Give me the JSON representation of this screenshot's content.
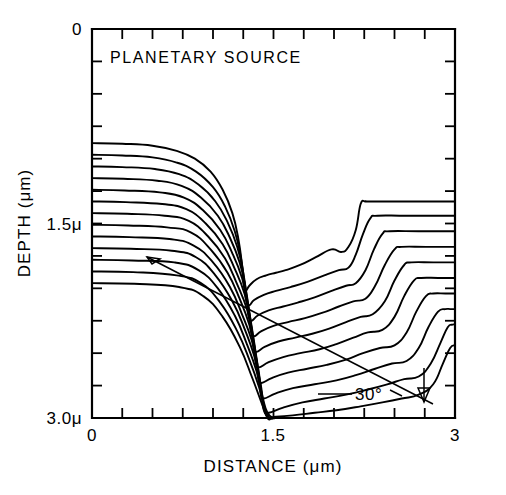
{
  "figure": {
    "title": "PLANETARY SOURCE",
    "annotation_angle": "30°",
    "background_color": "#ffffff",
    "line_color": "#000000"
  },
  "chart_data": {
    "type": "line",
    "title": "PLANETARY SOURCE",
    "xlabel": "DISTANCE  (μm)",
    "ylabel": "DEPTH  (μm)",
    "xlim": [
      0,
      3
    ],
    "ylim": [
      3,
      0
    ],
    "y_inverted": true,
    "grid": false,
    "legend": "none",
    "xticks": [
      0,
      0.25,
      0.5,
      0.75,
      1.0,
      1.25,
      1.5,
      1.75,
      2.0,
      2.25,
      2.5,
      2.75,
      3.0
    ],
    "xticklabels": [
      "0",
      "",
      "",
      "",
      "",
      "",
      "1.5",
      "",
      "",
      "",
      "",
      "",
      "3"
    ],
    "yticks": [
      0,
      0.25,
      0.5,
      0.75,
      1.0,
      1.25,
      1.5,
      1.75,
      2.0,
      2.25,
      2.5,
      2.75,
      3.0
    ],
    "yticklabels": [
      "0",
      "",
      "",
      "",
      "",
      "",
      "1.5μ",
      "",
      "",
      "",
      "",
      "",
      "3.0μ"
    ],
    "annotations": [
      {
        "text": "PLANETARY SOURCE",
        "x": 0.16,
        "y": 0.22
      },
      {
        "text": "30°",
        "x": 2.09,
        "y": 2.82
      },
      {
        "text": "ion-beam-direction-arrow",
        "from_x": 0.46,
        "from_y": 1.72,
        "to_x": 2.58,
        "to_y": 2.95
      }
    ],
    "series": [
      {
        "name": "profile-01",
        "x": [
          0.0,
          0.25,
          0.5,
          0.7,
          0.85,
          0.98,
          1.08,
          1.16,
          1.21,
          1.24,
          1.255,
          1.27,
          1.3,
          1.36,
          1.44,
          1.52,
          1.6,
          1.72,
          1.85,
          1.98,
          2.06,
          2.12,
          2.18,
          2.22,
          2.26,
          2.3,
          2.6,
          3.0
        ],
        "y": [
          0.88,
          0.885,
          0.9,
          0.94,
          1.0,
          1.1,
          1.24,
          1.42,
          1.62,
          1.82,
          1.98,
          2.02,
          1.98,
          1.93,
          1.9,
          1.88,
          1.86,
          1.82,
          1.76,
          1.7,
          1.72,
          1.68,
          1.55,
          1.35,
          1.33,
          1.33,
          1.33,
          1.33
        ]
      },
      {
        "name": "profile-02",
        "x": [
          0.0,
          0.25,
          0.5,
          0.7,
          0.86,
          1.0,
          1.1,
          1.18,
          1.23,
          1.26,
          1.275,
          1.3,
          1.34,
          1.42,
          1.52,
          1.64,
          1.78,
          1.92,
          2.04,
          2.12,
          2.18,
          2.24,
          2.3,
          2.36,
          2.6,
          3.0
        ],
        "y": [
          0.97,
          0.975,
          0.99,
          1.03,
          1.1,
          1.22,
          1.37,
          1.56,
          1.76,
          1.96,
          2.1,
          2.13,
          2.09,
          2.05,
          2.02,
          1.99,
          1.95,
          1.9,
          1.86,
          1.84,
          1.74,
          1.58,
          1.46,
          1.44,
          1.44,
          1.44
        ]
      },
      {
        "name": "profile-03",
        "x": [
          0.0,
          0.25,
          0.52,
          0.72,
          0.88,
          1.02,
          1.12,
          1.2,
          1.25,
          1.28,
          1.295,
          1.32,
          1.37,
          1.46,
          1.58,
          1.7,
          1.84,
          1.98,
          2.1,
          2.18,
          2.26,
          2.33,
          2.4,
          2.46,
          2.7,
          3.0
        ],
        "y": [
          1.06,
          1.065,
          1.08,
          1.12,
          1.2,
          1.33,
          1.49,
          1.68,
          1.88,
          2.08,
          2.22,
          2.25,
          2.21,
          2.17,
          2.14,
          2.11,
          2.07,
          2.02,
          1.98,
          1.96,
          1.86,
          1.7,
          1.58,
          1.56,
          1.56,
          1.56
        ]
      },
      {
        "name": "profile-04",
        "x": [
          0.0,
          0.26,
          0.54,
          0.74,
          0.9,
          1.04,
          1.14,
          1.22,
          1.27,
          1.3,
          1.315,
          1.34,
          1.4,
          1.5,
          1.62,
          1.76,
          1.9,
          2.04,
          2.16,
          2.26,
          2.34,
          2.42,
          2.5,
          2.56,
          2.76,
          3.0
        ],
        "y": [
          1.15,
          1.155,
          1.17,
          1.21,
          1.3,
          1.44,
          1.61,
          1.8,
          2.0,
          2.2,
          2.34,
          2.37,
          2.33,
          2.29,
          2.26,
          2.23,
          2.19,
          2.14,
          2.1,
          2.08,
          1.98,
          1.82,
          1.7,
          1.68,
          1.68,
          1.68
        ]
      },
      {
        "name": "profile-05",
        "x": [
          0.0,
          0.27,
          0.56,
          0.76,
          0.92,
          1.06,
          1.16,
          1.24,
          1.29,
          1.32,
          1.335,
          1.36,
          1.43,
          1.54,
          1.68,
          1.82,
          1.96,
          2.1,
          2.22,
          2.32,
          2.42,
          2.5,
          2.58,
          2.64,
          2.82,
          3.0
        ],
        "y": [
          1.24,
          1.245,
          1.26,
          1.3,
          1.4,
          1.55,
          1.73,
          1.92,
          2.12,
          2.32,
          2.46,
          2.49,
          2.45,
          2.41,
          2.38,
          2.35,
          2.31,
          2.26,
          2.22,
          2.2,
          2.1,
          1.94,
          1.82,
          1.8,
          1.8,
          1.8
        ]
      },
      {
        "name": "profile-06",
        "x": [
          0.0,
          0.28,
          0.58,
          0.78,
          0.94,
          1.08,
          1.18,
          1.26,
          1.31,
          1.34,
          1.355,
          1.38,
          1.46,
          1.58,
          1.72,
          1.88,
          2.02,
          2.16,
          2.28,
          2.4,
          2.5,
          2.58,
          2.66,
          2.72,
          2.86,
          3.0
        ],
        "y": [
          1.33,
          1.335,
          1.35,
          1.39,
          1.5,
          1.66,
          1.85,
          2.04,
          2.24,
          2.44,
          2.58,
          2.61,
          2.57,
          2.53,
          2.5,
          2.47,
          2.43,
          2.38,
          2.34,
          2.32,
          2.22,
          2.06,
          1.94,
          1.92,
          1.92,
          1.92
        ]
      },
      {
        "name": "profile-07",
        "x": [
          0.0,
          0.29,
          0.6,
          0.8,
          0.96,
          1.1,
          1.2,
          1.28,
          1.33,
          1.36,
          1.375,
          1.4,
          1.49,
          1.62,
          1.78,
          1.94,
          2.1,
          2.24,
          2.38,
          2.5,
          2.6,
          2.68,
          2.76,
          2.82,
          2.92,
          3.0
        ],
        "y": [
          1.42,
          1.425,
          1.44,
          1.48,
          1.6,
          1.77,
          1.97,
          2.16,
          2.36,
          2.56,
          2.7,
          2.73,
          2.69,
          2.65,
          2.62,
          2.59,
          2.55,
          2.5,
          2.46,
          2.44,
          2.34,
          2.18,
          2.06,
          2.04,
          2.04,
          2.04
        ]
      },
      {
        "name": "profile-08",
        "x": [
          0.0,
          0.3,
          0.62,
          0.82,
          0.98,
          1.12,
          1.22,
          1.3,
          1.35,
          1.38,
          1.395,
          1.42,
          1.52,
          1.66,
          1.84,
          2.02,
          2.18,
          2.34,
          2.48,
          2.6,
          2.7,
          2.78,
          2.86,
          2.92,
          2.96,
          3.0
        ],
        "y": [
          1.51,
          1.515,
          1.53,
          1.57,
          1.7,
          1.88,
          2.08,
          2.28,
          2.48,
          2.68,
          2.82,
          2.85,
          2.81,
          2.77,
          2.74,
          2.71,
          2.67,
          2.62,
          2.58,
          2.56,
          2.46,
          2.3,
          2.18,
          2.16,
          2.16,
          2.16
        ]
      },
      {
        "name": "profile-09",
        "x": [
          0.0,
          0.31,
          0.64,
          0.84,
          1.0,
          1.14,
          1.24,
          1.32,
          1.37,
          1.4,
          1.42,
          1.46,
          1.58,
          1.74,
          1.92,
          2.1,
          2.28,
          2.44,
          2.58,
          2.7,
          2.8,
          2.88,
          2.94,
          2.98,
          3.0
        ],
        "y": [
          1.6,
          1.605,
          1.62,
          1.67,
          1.8,
          1.99,
          2.2,
          2.4,
          2.6,
          2.8,
          2.94,
          2.96,
          2.92,
          2.88,
          2.85,
          2.82,
          2.78,
          2.74,
          2.7,
          2.68,
          2.58,
          2.42,
          2.3,
          2.28,
          2.28
        ]
      },
      {
        "name": "profile-10",
        "x": [
          0.0,
          0.32,
          0.66,
          0.86,
          1.02,
          1.16,
          1.26,
          1.34,
          1.39,
          1.42,
          1.45,
          1.52,
          1.66,
          1.84,
          2.02,
          2.22,
          2.4,
          2.56,
          2.7,
          2.82,
          2.9,
          2.96,
          3.0
        ],
        "y": [
          1.69,
          1.695,
          1.71,
          1.76,
          1.9,
          2.1,
          2.31,
          2.52,
          2.72,
          2.9,
          2.99,
          2.99,
          2.98,
          2.96,
          2.94,
          2.91,
          2.88,
          2.85,
          2.82,
          2.74,
          2.58,
          2.46,
          2.44
        ]
      },
      {
        "name": "profile-11",
        "x": [
          0.0,
          0.33,
          0.68,
          0.88,
          1.04,
          1.18,
          1.28,
          1.36,
          1.41,
          1.45,
          1.5,
          1.5
        ],
        "y": [
          1.78,
          1.785,
          1.8,
          1.86,
          2.0,
          2.21,
          2.43,
          2.64,
          2.84,
          2.96,
          3.0,
          3.0
        ]
      },
      {
        "name": "profile-12",
        "x": [
          0.0,
          0.34,
          0.7,
          0.9,
          1.06,
          1.2,
          1.3,
          1.38,
          1.43,
          1.47,
          1.5
        ],
        "y": [
          1.87,
          1.875,
          1.9,
          1.96,
          2.11,
          2.33,
          2.55,
          2.76,
          2.93,
          3.0,
          3.0
        ]
      },
      {
        "name": "profile-13",
        "x": [
          0.0,
          0.35,
          0.72,
          0.92,
          1.08,
          1.22,
          1.32,
          1.4,
          1.45,
          1.48
        ],
        "y": [
          1.96,
          1.965,
          1.99,
          2.06,
          2.22,
          2.45,
          2.68,
          2.88,
          3.0,
          3.0
        ]
      }
    ]
  },
  "axes": {
    "x_title": "DISTANCE  (μm)",
    "y_title": "DEPTH  (μm)",
    "x_tick_labels": [
      {
        "value": "0",
        "pos": 0
      },
      {
        "value": "1.5",
        "pos": 1.5
      },
      {
        "value": "3",
        "pos": 3
      }
    ],
    "y_tick_labels": [
      {
        "value": "0",
        "pos": 0
      },
      {
        "value": "1.5μ",
        "pos": 1.5
      },
      {
        "value": "3.0μ",
        "pos": 3.0
      }
    ]
  }
}
